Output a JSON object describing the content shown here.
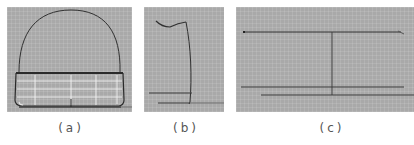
{
  "figure": {
    "panels": [
      {
        "id": "a",
        "caption": "(a)",
        "description": "Front view: dome-shaped outline above a trapezoidal gridded base band"
      },
      {
        "id": "b",
        "caption": "(b)",
        "description": "Side view: tall curved profile with wavy top edge and two horizontal base lines"
      },
      {
        "id": "c",
        "caption": "(c)",
        "description": "Top view: long horizontal line with vertical center axis and two base lines"
      }
    ],
    "colors": {
      "panel_background": "#a9a9a9",
      "outline": "#2e2e2e",
      "grid_highlight": "#f2f2f2",
      "caption_text": "#555555"
    }
  }
}
